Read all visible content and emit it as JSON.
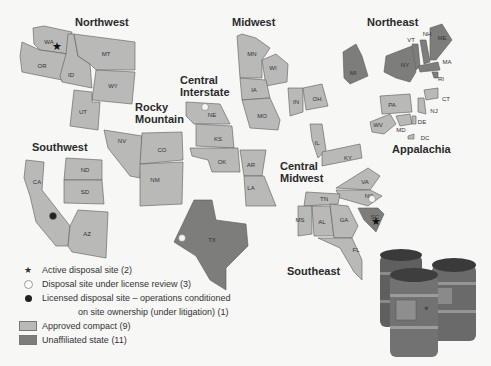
{
  "regions": [
    {
      "name": "Northwest",
      "x": 75,
      "y": 26
    },
    {
      "name": "Midwest",
      "x": 232,
      "y": 26
    },
    {
      "name": "Northeast",
      "x": 367,
      "y": 26
    },
    {
      "name": "Central",
      "x": 180,
      "y": 84
    },
    {
      "name": "Interstate",
      "x": 180,
      "y": 96
    },
    {
      "name": "Rocky",
      "x": 135,
      "y": 111
    },
    {
      "name": "Mountain",
      "x": 135,
      "y": 123
    },
    {
      "name": "Southwest",
      "x": 32,
      "y": 151
    },
    {
      "name": "Appalachia",
      "x": 392,
      "y": 153
    },
    {
      "name": "Central",
      "x": 280,
      "y": 170
    },
    {
      "name": "Midwest",
      "x": 280,
      "y": 182
    },
    {
      "name": "Southeast",
      "x": 287,
      "y": 275
    }
  ],
  "states": [
    {
      "abbr": "WA",
      "x": 49,
      "y": 42,
      "region": "Northwest",
      "status": "compact"
    },
    {
      "abbr": "OR",
      "x": 42,
      "y": 66,
      "region": "Northwest",
      "status": "compact"
    },
    {
      "abbr": "ID",
      "x": 71,
      "y": 75,
      "region": "Northwest",
      "status": "compact"
    },
    {
      "abbr": "MT",
      "x": 106,
      "y": 54,
      "region": "Northwest",
      "status": "compact"
    },
    {
      "abbr": "WY",
      "x": 113,
      "y": 86,
      "region": "Northwest",
      "status": "compact"
    },
    {
      "abbr": "UT",
      "x": 83,
      "y": 112,
      "region": "Northwest",
      "status": "compact"
    },
    {
      "abbr": "NV",
      "x": 122,
      "y": 141,
      "region": "Rocky Mountain",
      "status": "compact"
    },
    {
      "abbr": "CO",
      "x": 162,
      "y": 150,
      "region": "Rocky Mountain",
      "status": "compact"
    },
    {
      "abbr": "NM",
      "x": 155,
      "y": 180,
      "region": "Rocky Mountain",
      "status": "compact"
    },
    {
      "abbr": "CA",
      "x": 37,
      "y": 182,
      "region": "Southwest",
      "status": "compact"
    },
    {
      "abbr": "ND",
      "x": 85,
      "y": 170,
      "region": "Southwest",
      "status": "compact"
    },
    {
      "abbr": "SD",
      "x": 85,
      "y": 192,
      "region": "Southwest",
      "status": "compact"
    },
    {
      "abbr": "AZ",
      "x": 87,
      "y": 234,
      "region": "Southwest",
      "status": "compact"
    },
    {
      "abbr": "MN",
      "x": 252,
      "y": 54,
      "region": "Midwest",
      "status": "compact"
    },
    {
      "abbr": "WI",
      "x": 273,
      "y": 68,
      "region": "Midwest",
      "status": "compact"
    },
    {
      "abbr": "IA",
      "x": 254,
      "y": 90,
      "region": "Midwest",
      "status": "compact"
    },
    {
      "abbr": "MO",
      "x": 262,
      "y": 116,
      "region": "Midwest",
      "status": "compact"
    },
    {
      "abbr": "IN",
      "x": 296,
      "y": 102,
      "region": "Midwest",
      "status": "compact"
    },
    {
      "abbr": "OH",
      "x": 317,
      "y": 99,
      "region": "Midwest",
      "status": "compact"
    },
    {
      "abbr": "NE",
      "x": 212,
      "y": 115,
      "region": "Central Interstate",
      "status": "compact"
    },
    {
      "abbr": "KS",
      "x": 218,
      "y": 139,
      "region": "Central Interstate",
      "status": "compact"
    },
    {
      "abbr": "OK",
      "x": 222,
      "y": 162,
      "region": "Central Interstate",
      "status": "compact"
    },
    {
      "abbr": "AR",
      "x": 251,
      "y": 165,
      "region": "Central Interstate",
      "status": "compact"
    },
    {
      "abbr": "LA",
      "x": 251,
      "y": 188,
      "region": "Central Interstate",
      "status": "compact"
    },
    {
      "abbr": "IL",
      "x": 317,
      "y": 143,
      "region": "Central Midwest",
      "status": "compact"
    },
    {
      "abbr": "KY",
      "x": 348,
      "y": 158,
      "region": "Central Midwest",
      "status": "compact"
    },
    {
      "abbr": "TX",
      "x": 212,
      "y": 240,
      "region": "",
      "status": "unaffiliated"
    },
    {
      "abbr": "MI",
      "x": 353,
      "y": 73,
      "region": "",
      "status": "unaffiliated"
    },
    {
      "abbr": "NY",
      "x": 405,
      "y": 65,
      "region": "Northeast",
      "status": "unaffiliated"
    },
    {
      "abbr": "VT",
      "x": 411,
      "y": 40,
      "region": "Northeast",
      "status": "unaffiliated"
    },
    {
      "abbr": "NH",
      "x": 427,
      "y": 34,
      "region": "Northeast",
      "status": "unaffiliated"
    },
    {
      "abbr": "ME",
      "x": 442,
      "y": 38,
      "region": "Northeast",
      "status": "unaffiliated"
    },
    {
      "abbr": "MA",
      "x": 447,
      "y": 62,
      "region": "Northeast",
      "status": "unaffiliated"
    },
    {
      "abbr": "RI",
      "x": 441,
      "y": 79,
      "region": "Northeast",
      "status": "unaffiliated"
    },
    {
      "abbr": "CT",
      "x": 446,
      "y": 99,
      "region": "Northeast",
      "status": "compact"
    },
    {
      "abbr": "NJ",
      "x": 434,
      "y": 111,
      "region": "Northeast",
      "status": "compact"
    },
    {
      "abbr": "PA",
      "x": 392,
      "y": 105,
      "region": "Appalachia",
      "status": "compact"
    },
    {
      "abbr": "WV",
      "x": 378,
      "y": 125,
      "region": "Appalachia",
      "status": "compact"
    },
    {
      "abbr": "MD",
      "x": 401,
      "y": 130,
      "region": "Appalachia",
      "status": "compact"
    },
    {
      "abbr": "DE",
      "x": 422,
      "y": 122,
      "region": "Appalachia",
      "status": "compact"
    },
    {
      "abbr": "DC",
      "x": 425,
      "y": 138,
      "region": "",
      "status": "compact"
    },
    {
      "abbr": "VA",
      "x": 365,
      "y": 182,
      "region": "Southeast",
      "status": "compact"
    },
    {
      "abbr": "NC",
      "x": 369,
      "y": 196,
      "region": "Southeast",
      "status": "compact"
    },
    {
      "abbr": "SC",
      "x": 375,
      "y": 217,
      "region": "Southeast",
      "status": "unaffiliated"
    },
    {
      "abbr": "TN",
      "x": 324,
      "y": 199,
      "region": "Southeast",
      "status": "compact"
    },
    {
      "abbr": "MS",
      "x": 300,
      "y": 220,
      "region": "Southeast",
      "status": "compact"
    },
    {
      "abbr": "AL",
      "x": 322,
      "y": 222,
      "region": "Southeast",
      "status": "compact"
    },
    {
      "abbr": "GA",
      "x": 344,
      "y": 220,
      "region": "Southeast",
      "status": "compact"
    },
    {
      "abbr": "FL",
      "x": 356,
      "y": 250,
      "region": "Southeast",
      "status": "compact"
    }
  ],
  "sites": [
    {
      "type": "active",
      "state": "WA",
      "x": 57,
      "y": 46
    },
    {
      "type": "active",
      "state": "SC",
      "x": 376,
      "y": 221
    },
    {
      "type": "review",
      "state": "NE",
      "x": 205,
      "y": 107
    },
    {
      "type": "review",
      "state": "TX",
      "x": 182,
      "y": 238
    },
    {
      "type": "review",
      "state": "NC",
      "x": 372,
      "y": 199
    },
    {
      "type": "litigation",
      "state": "CA",
      "x": 53,
      "y": 216
    }
  ],
  "legend": {
    "items": [
      {
        "symbol": "star-icon",
        "label": "Active disposal site (2)"
      },
      {
        "symbol": "open-circle-icon",
        "label": "Disposal site under license review (3)"
      },
      {
        "symbol": "filled-circle-icon",
        "label": "Licensed disposal site – operations conditioned"
      },
      {
        "symbol": "",
        "label": "on site ownership (under litigation) (1)"
      },
      {
        "symbol": "light-swatch",
        "label": "Approved compact (9)"
      },
      {
        "symbol": "dark-swatch",
        "label": "Unaffiliated state (11)"
      }
    ]
  },
  "colors": {
    "compact": "#b9b9b8",
    "unaffiliated": "#7d7d7c",
    "background": "#f7f7f6"
  }
}
